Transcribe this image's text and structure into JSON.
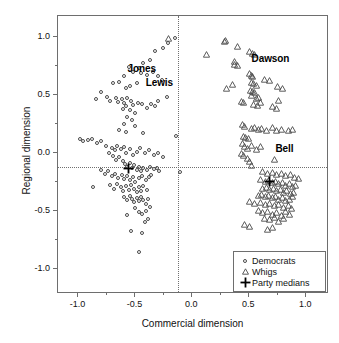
{
  "chart_data": {
    "type": "scatter",
    "title": "",
    "xlabel": "Commercial dimension",
    "ylabel": "Regional dimension",
    "xlim": [
      -1.18,
      1.2
    ],
    "ylim": [
      -1.22,
      1.18
    ],
    "xticks": [
      -1.0,
      -0.5,
      0.0,
      0.5,
      1.0
    ],
    "xticklabels": [
      "-1.0",
      "-0.5",
      "0.0",
      "0.5",
      "1.0"
    ],
    "yticks": [
      -1.0,
      -0.5,
      0.0,
      0.5,
      1.0
    ],
    "yticklabels": [
      "-1.0",
      "-0.5",
      "0.0",
      "0.5",
      "1.0"
    ],
    "grid": false,
    "legend_position": "lower-right",
    "reference_lines": {
      "vertical_x": -0.13,
      "horizontal_y": -0.12,
      "style": "dotted"
    },
    "series": [
      {
        "name": "Democrats",
        "marker": "open-circle",
        "points": [
          [
            -0.21,
            0.95
          ],
          [
            -0.15,
            0.99
          ],
          [
            -0.26,
            0.9
          ],
          [
            -0.33,
            0.88
          ],
          [
            -0.37,
            0.8
          ],
          [
            -0.43,
            0.77
          ],
          [
            -0.47,
            0.73
          ],
          [
            -0.52,
            0.7
          ],
          [
            -0.56,
            0.74
          ],
          [
            -0.6,
            0.66
          ],
          [
            -0.64,
            0.61
          ],
          [
            -0.7,
            0.6
          ],
          [
            -0.45,
            0.69
          ],
          [
            -0.4,
            0.67
          ],
          [
            -0.35,
            0.7
          ],
          [
            -0.3,
            0.66
          ],
          [
            -0.27,
            0.63
          ],
          [
            -0.49,
            0.6
          ],
          [
            -0.55,
            0.58
          ],
          [
            -0.58,
            0.56
          ],
          [
            -0.8,
            0.52
          ],
          [
            -0.85,
            0.46
          ],
          [
            -0.75,
            0.48
          ],
          [
            -0.72,
            0.45
          ],
          [
            -0.67,
            0.47
          ],
          [
            -0.65,
            0.44
          ],
          [
            -0.62,
            0.46
          ],
          [
            -0.6,
            0.43
          ],
          [
            -0.57,
            0.47
          ],
          [
            -0.54,
            0.45
          ],
          [
            -0.52,
            0.41
          ],
          [
            -0.48,
            0.43
          ],
          [
            -0.44,
            0.42
          ],
          [
            -0.4,
            0.39
          ],
          [
            -0.36,
            0.42
          ],
          [
            -0.5,
            0.34
          ],
          [
            -0.55,
            0.37
          ],
          [
            -0.58,
            0.4
          ],
          [
            -0.61,
            0.38
          ],
          [
            -0.22,
            0.48
          ],
          [
            -0.3,
            0.45
          ],
          [
            -0.33,
            0.4
          ],
          [
            -0.57,
            0.31
          ],
          [
            -0.53,
            0.28
          ],
          [
            -0.6,
            0.25
          ],
          [
            -0.64,
            0.2
          ],
          [
            -0.58,
            0.18
          ],
          [
            -0.43,
            0.17
          ],
          [
            -0.5,
            0.23
          ],
          [
            -0.14,
            0.14
          ],
          [
            -0.99,
            0.12
          ],
          [
            -0.96,
            0.1
          ],
          [
            -0.92,
            0.11
          ],
          [
            -0.88,
            0.12
          ],
          [
            -0.84,
            0.08
          ],
          [
            -0.8,
            0.1
          ],
          [
            -0.76,
            0.06
          ],
          [
            -0.71,
            0.04
          ],
          [
            -0.68,
            0.02
          ],
          [
            -0.66,
            0.06
          ],
          [
            -0.63,
            0.03
          ],
          [
            -0.6,
            0.05
          ],
          [
            -0.58,
            0.0
          ],
          [
            -0.55,
            0.03
          ],
          [
            -0.52,
            -0.02
          ],
          [
            -0.49,
            0.01
          ],
          [
            -0.46,
            0.04
          ],
          [
            -0.42,
            0.0
          ],
          [
            -0.38,
            0.02
          ],
          [
            -0.34,
            -0.02
          ],
          [
            -0.3,
            0.0
          ],
          [
            -0.26,
            -0.04
          ],
          [
            -0.73,
            0.0
          ],
          [
            -0.7,
            -0.03
          ],
          [
            -0.67,
            -0.06
          ],
          [
            -0.64,
            -0.04
          ],
          [
            -0.61,
            -0.07
          ],
          [
            -0.59,
            -0.1
          ],
          [
            -0.57,
            -0.12
          ],
          [
            -0.55,
            -0.09
          ],
          [
            -0.53,
            -0.13
          ],
          [
            -0.51,
            -0.11
          ],
          [
            -0.49,
            -0.15
          ],
          [
            -0.47,
            -0.12
          ],
          [
            -0.45,
            -0.16
          ],
          [
            -0.43,
            -0.13
          ],
          [
            -0.4,
            -0.15
          ],
          [
            -0.37,
            -0.12
          ],
          [
            -0.34,
            -0.14
          ],
          [
            -0.31,
            -0.13
          ],
          [
            -0.29,
            -0.16
          ],
          [
            -0.11,
            -0.17
          ],
          [
            -0.8,
            -0.15
          ],
          [
            -0.77,
            -0.18
          ],
          [
            -0.74,
            -0.16
          ],
          [
            -0.71,
            -0.2
          ],
          [
            -0.68,
            -0.18
          ],
          [
            -0.65,
            -0.22
          ],
          [
            -0.62,
            -0.19
          ],
          [
            -0.6,
            -0.23
          ],
          [
            -0.57,
            -0.2
          ],
          [
            -0.55,
            -0.24
          ],
          [
            -0.52,
            -0.21
          ],
          [
            -0.5,
            -0.25
          ],
          [
            -0.47,
            -0.22
          ],
          [
            -0.44,
            -0.2
          ],
          [
            -0.41,
            -0.24
          ],
          [
            -0.38,
            -0.21
          ],
          [
            -0.36,
            -0.19
          ],
          [
            -0.87,
            -0.3
          ],
          [
            -0.72,
            -0.28
          ],
          [
            -0.69,
            -0.31
          ],
          [
            -0.66,
            -0.27
          ],
          [
            -0.63,
            -0.3
          ],
          [
            -0.61,
            -0.33
          ],
          [
            -0.58,
            -0.29
          ],
          [
            -0.56,
            -0.32
          ],
          [
            -0.54,
            -0.28
          ],
          [
            -0.51,
            -0.31
          ],
          [
            -0.49,
            -0.34
          ],
          [
            -0.47,
            -0.3
          ],
          [
            -0.45,
            -0.33
          ],
          [
            -0.43,
            -0.29
          ],
          [
            -0.4,
            -0.32
          ],
          [
            -0.6,
            -0.38
          ],
          [
            -0.57,
            -0.41
          ],
          [
            -0.55,
            -0.37
          ],
          [
            -0.53,
            -0.4
          ],
          [
            -0.51,
            -0.43
          ],
          [
            -0.49,
            -0.39
          ],
          [
            -0.47,
            -0.42
          ],
          [
            -0.45,
            -0.38
          ],
          [
            -0.43,
            -0.41
          ],
          [
            -0.41,
            -0.44
          ],
          [
            -0.39,
            -0.4
          ],
          [
            -0.37,
            -0.47
          ],
          [
            -0.5,
            -0.48
          ],
          [
            -0.47,
            -0.51
          ],
          [
            -0.44,
            -0.53
          ],
          [
            -0.41,
            -0.5
          ],
          [
            -0.57,
            -0.54
          ],
          [
            -0.39,
            -0.57
          ],
          [
            -0.42,
            -0.6
          ],
          [
            -0.54,
            -0.68
          ],
          [
            -0.44,
            -0.69
          ],
          [
            -0.47,
            -0.86
          ]
        ]
      },
      {
        "name": "Whigs",
        "marker": "open-triangle",
        "points": [
          [
            0.28,
            0.96
          ],
          [
            0.29,
            0.97
          ],
          [
            0.4,
            0.92
          ],
          [
            0.12,
            0.85
          ],
          [
            0.5,
            0.87
          ],
          [
            0.53,
            0.86
          ],
          [
            0.55,
            0.85
          ],
          [
            0.37,
            0.76
          ],
          [
            0.4,
            0.75
          ],
          [
            0.5,
            0.68
          ],
          [
            0.52,
            0.67
          ],
          [
            0.53,
            0.66
          ],
          [
            0.63,
            0.63
          ],
          [
            0.68,
            0.62
          ],
          [
            0.35,
            0.59
          ],
          [
            0.52,
            0.61
          ],
          [
            0.54,
            0.6
          ],
          [
            0.56,
            0.58
          ],
          [
            0.3,
            0.55
          ],
          [
            0.75,
            0.57
          ],
          [
            0.79,
            0.55
          ],
          [
            0.51,
            0.54
          ],
          [
            0.53,
            0.53
          ],
          [
            0.55,
            0.52
          ],
          [
            0.52,
            0.49
          ],
          [
            0.56,
            0.47
          ],
          [
            0.58,
            0.48
          ],
          [
            0.43,
            0.44
          ],
          [
            0.45,
            0.43
          ],
          [
            0.54,
            0.42
          ],
          [
            0.57,
            0.41
          ],
          [
            0.6,
            0.43
          ],
          [
            0.7,
            0.4
          ],
          [
            0.76,
            0.45
          ],
          [
            0.74,
            0.38
          ],
          [
            0.44,
            0.24
          ],
          [
            0.46,
            0.23
          ],
          [
            0.52,
            0.21
          ],
          [
            0.55,
            0.22
          ],
          [
            0.58,
            0.2
          ],
          [
            0.61,
            0.21
          ],
          [
            0.65,
            0.19
          ],
          [
            0.7,
            0.22
          ],
          [
            0.74,
            0.19
          ],
          [
            0.78,
            0.2
          ],
          [
            0.84,
            0.19
          ],
          [
            0.88,
            0.2
          ],
          [
            0.45,
            0.14
          ],
          [
            0.47,
            0.13
          ],
          [
            0.49,
            0.12
          ],
          [
            0.44,
            0.08
          ],
          [
            0.46,
            0.05
          ],
          [
            0.48,
            0.04
          ],
          [
            0.52,
            0.06
          ],
          [
            0.56,
            0.03
          ],
          [
            0.6,
            0.05
          ],
          [
            0.43,
            -0.01
          ],
          [
            0.45,
            -0.02
          ],
          [
            0.48,
            -0.05
          ],
          [
            0.5,
            -0.08
          ],
          [
            0.52,
            -0.11
          ],
          [
            0.72,
            -0.06
          ],
          [
            -0.21,
            0.99
          ],
          [
            0.37,
            0.79
          ],
          [
            0.62,
            -0.16
          ],
          [
            0.66,
            -0.18
          ],
          [
            0.7,
            -0.17
          ],
          [
            0.74,
            -0.19
          ],
          [
            0.78,
            -0.18
          ],
          [
            0.82,
            -0.2
          ],
          [
            0.86,
            -0.19
          ],
          [
            0.9,
            -0.21
          ],
          [
            0.93,
            -0.22
          ],
          [
            0.6,
            -0.23
          ],
          [
            0.64,
            -0.25
          ],
          [
            0.67,
            -0.24
          ],
          [
            0.7,
            -0.26
          ],
          [
            0.73,
            -0.25
          ],
          [
            0.76,
            -0.27
          ],
          [
            0.79,
            -0.26
          ],
          [
            0.82,
            -0.28
          ],
          [
            0.85,
            -0.27
          ],
          [
            0.88,
            -0.29
          ],
          [
            0.91,
            -0.28
          ],
          [
            0.62,
            -0.31
          ],
          [
            0.65,
            -0.3
          ],
          [
            0.68,
            -0.32
          ],
          [
            0.71,
            -0.31
          ],
          [
            0.74,
            -0.33
          ],
          [
            0.77,
            -0.32
          ],
          [
            0.8,
            -0.34
          ],
          [
            0.83,
            -0.33
          ],
          [
            0.86,
            -0.35
          ],
          [
            0.89,
            -0.34
          ],
          [
            0.58,
            -0.37
          ],
          [
            0.61,
            -0.36
          ],
          [
            0.64,
            -0.38
          ],
          [
            0.67,
            -0.37
          ],
          [
            0.7,
            -0.39
          ],
          [
            0.73,
            -0.38
          ],
          [
            0.76,
            -0.4
          ],
          [
            0.79,
            -0.39
          ],
          [
            0.82,
            -0.41
          ],
          [
            0.85,
            -0.4
          ],
          [
            0.88,
            -0.38
          ],
          [
            0.5,
            -0.42
          ],
          [
            0.55,
            -0.44
          ],
          [
            0.6,
            -0.43
          ],
          [
            0.64,
            -0.45
          ],
          [
            0.68,
            -0.44
          ],
          [
            0.72,
            -0.46
          ],
          [
            0.76,
            -0.45
          ],
          [
            0.8,
            -0.47
          ],
          [
            0.84,
            -0.46
          ],
          [
            0.87,
            -0.48
          ],
          [
            0.58,
            -0.5
          ],
          [
            0.62,
            -0.52
          ],
          [
            0.66,
            -0.51
          ],
          [
            0.7,
            -0.53
          ],
          [
            0.74,
            -0.52
          ],
          [
            0.78,
            -0.54
          ],
          [
            0.82,
            -0.51
          ],
          [
            0.85,
            -0.53
          ],
          [
            0.63,
            -0.57
          ],
          [
            0.68,
            -0.58
          ],
          [
            0.72,
            -0.56
          ],
          [
            0.76,
            -0.59
          ],
          [
            0.8,
            -0.57
          ],
          [
            0.5,
            -0.64
          ],
          [
            0.66,
            -0.66
          ],
          [
            0.7,
            -0.65
          ],
          [
            0.46,
            -0.62
          ]
        ]
      },
      {
        "name": "Party medians",
        "marker": "plus",
        "points": [
          [
            -0.56,
            -0.11
          ],
          [
            0.68,
            -0.22
          ]
        ]
      }
    ],
    "annotations": [
      {
        "text": "Jones",
        "x": -0.57,
        "y": 0.72
      },
      {
        "text": "Lewis",
        "x": -0.41,
        "y": 0.6
      },
      {
        "text": "Dawson",
        "x": 0.52,
        "y": 0.81
      },
      {
        "text": "Bell",
        "x": 0.73,
        "y": 0.03
      }
    ],
    "legend": {
      "items": [
        {
          "label": "Democrats",
          "marker": "open-circle"
        },
        {
          "label": "Whigs",
          "marker": "open-triangle"
        },
        {
          "label": "Party medians",
          "marker": "plus"
        }
      ]
    },
    "colors": {
      "marker_stroke": "#4a4a4a",
      "frame": "#6e6e6e",
      "text": "#111111",
      "background": "#ffffff"
    }
  }
}
